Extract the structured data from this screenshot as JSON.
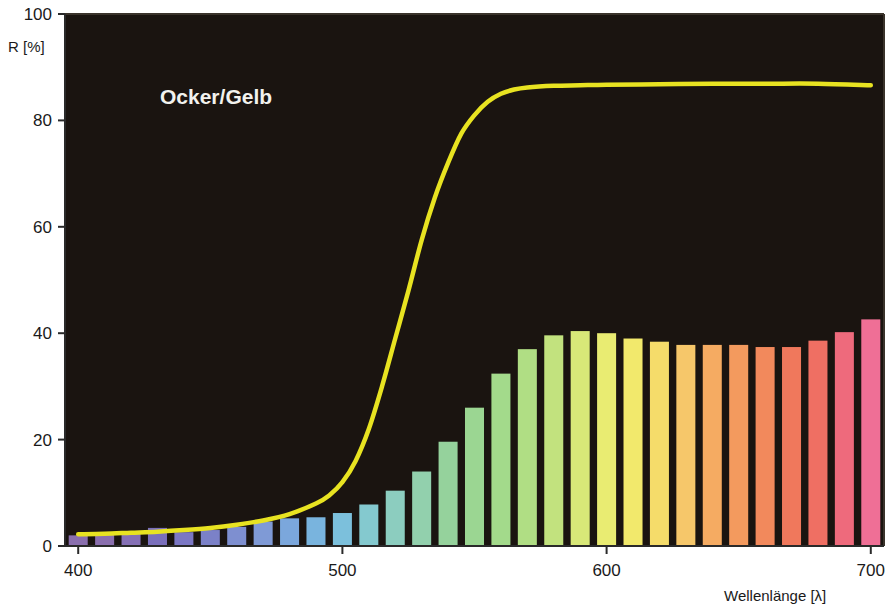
{
  "chart_data": {
    "type": "bar",
    "title": "Ocker/Gelb",
    "xlabel": "Wellenlänge [λ]",
    "ylabel": "R [%]",
    "xlim": [
      395,
      705
    ],
    "ylim": [
      0,
      100
    ],
    "grid": false,
    "legend_position": "none",
    "plot_background": "#1a1410",
    "x": [
      400,
      410,
      420,
      430,
      440,
      450,
      460,
      470,
      480,
      490,
      500,
      510,
      520,
      530,
      540,
      550,
      560,
      570,
      580,
      590,
      600,
      610,
      620,
      630,
      640,
      650,
      660,
      670,
      680,
      690,
      700
    ],
    "categories": [
      "400",
      "410",
      "420",
      "430",
      "440",
      "450",
      "460",
      "470",
      "480",
      "490",
      "500",
      "510",
      "520",
      "530",
      "540",
      "550",
      "560",
      "570",
      "580",
      "590",
      "600",
      "610",
      "620",
      "630",
      "640",
      "650",
      "660",
      "670",
      "680",
      "690",
      "700"
    ],
    "series": [
      {
        "name": "Spektralbalken",
        "type": "bar",
        "values": [
          2.0,
          2.2,
          2.4,
          3.4,
          2.6,
          3.0,
          3.6,
          4.6,
          5.2,
          5.4,
          6.2,
          7.8,
          10.4,
          14.0,
          19.6,
          26.0,
          32.4,
          37.0,
          39.6,
          40.4,
          40.0,
          39.0,
          38.4,
          37.8,
          37.8,
          37.8,
          37.4,
          37.4,
          38.6,
          40.2,
          42.6
        ],
        "colors": [
          "#8a6fae",
          "#8a6fae",
          "#8570b5",
          "#7a6fbb",
          "#7b77c4",
          "#7b81c8",
          "#7e8fd0",
          "#7f9ad6",
          "#7ba7dc",
          "#79b4de",
          "#7cc0dc",
          "#84c9cf",
          "#8ccdbf",
          "#92d0ad",
          "#95d29c",
          "#9bd692",
          "#a3da8b",
          "#b0de84",
          "#c2e27e",
          "#d8e878",
          "#e9ec72",
          "#f2e96c",
          "#f5dc6a",
          "#f6c76a",
          "#f5ab62",
          "#f39a5e",
          "#f2895c",
          "#f0785c",
          "#ef6f63",
          "#ee6a7c",
          "#ef6f96"
        ]
      },
      {
        "name": "Reflexionskurve",
        "type": "line",
        "color": "#e8e321",
        "x": [
          400,
          410,
          420,
          430,
          440,
          450,
          460,
          470,
          480,
          490,
          495,
          500,
          505,
          510,
          515,
          520,
          525,
          530,
          535,
          540,
          545,
          550,
          555,
          560,
          565,
          570,
          580,
          590,
          600,
          620,
          640,
          660,
          680,
          700
        ],
        "values": [
          2.2,
          2.3,
          2.5,
          2.7,
          3.0,
          3.4,
          4.0,
          4.8,
          6.0,
          8.0,
          9.5,
          12.0,
          16.0,
          22.0,
          30.0,
          39.0,
          48.0,
          57.5,
          65.5,
          72.0,
          77.5,
          81.0,
          83.5,
          85.0,
          85.8,
          86.2,
          86.5,
          86.6,
          86.7,
          86.8,
          86.9,
          86.9,
          86.9,
          86.6
        ]
      }
    ],
    "xticks": [
      400,
      500,
      600,
      700
    ],
    "xtick_labels": [
      "400",
      "500",
      "600",
      "700"
    ],
    "yticks": [
      0,
      20,
      40,
      60,
      80,
      100
    ],
    "ytick_labels": [
      "0",
      "20",
      "40",
      "60",
      "80",
      "100"
    ]
  },
  "colors": {
    "curve": "#e8e321",
    "plot_bg": "#1a1410",
    "frame": "#4a4238",
    "text": "#1a1a1a",
    "title_text": "#f2f2ee"
  }
}
